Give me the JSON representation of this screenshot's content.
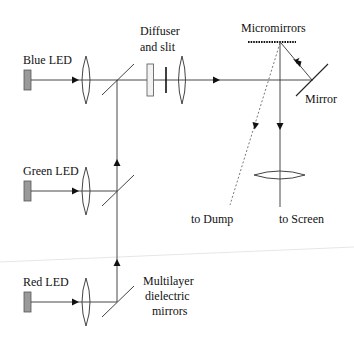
{
  "diagram": {
    "title": "",
    "labels": {
      "blue_led": "Blue LED",
      "green_led": "Green LED",
      "red_led": "Red LED",
      "diffuser_line1": "Diffuser",
      "diffuser_line2": "and slit",
      "micromirrors": "Micromirrors",
      "mirror": "Mirror",
      "to_dump": "to Dump",
      "to_screen": "to Screen",
      "dichroic_line1": "Multilayer",
      "dichroic_line2": "dielectric",
      "dichroic_line3": "mirrors"
    },
    "components": [
      {
        "id": "blue-led",
        "type": "light-source",
        "label": "Blue LED"
      },
      {
        "id": "green-led",
        "type": "light-source",
        "label": "Green LED"
      },
      {
        "id": "red-led",
        "type": "light-source",
        "label": "Red LED"
      },
      {
        "id": "condenser-lenses",
        "type": "lens",
        "count": 3
      },
      {
        "id": "dichroic-mirrors",
        "type": "beam-combiner",
        "label": "Multilayer dielectric mirrors",
        "count": 3
      },
      {
        "id": "diffuser",
        "type": "diffuser",
        "label": "Diffuser and slit"
      },
      {
        "id": "slit",
        "type": "slit"
      },
      {
        "id": "collimating-lens",
        "type": "lens"
      },
      {
        "id": "fold-mirror",
        "type": "mirror",
        "label": "Mirror"
      },
      {
        "id": "micromirror-array",
        "type": "dmd",
        "label": "Micromirrors"
      },
      {
        "id": "projection-lens",
        "type": "lens"
      }
    ],
    "paths": [
      {
        "from": "Red LED",
        "to": "Multilayer dielectric mirrors",
        "style": "solid"
      },
      {
        "from": "Green LED",
        "to": "Multilayer dielectric mirrors",
        "style": "solid"
      },
      {
        "from": "Blue LED",
        "to": "Multilayer dielectric mirrors",
        "style": "solid"
      },
      {
        "from": "Multilayer dielectric mirrors",
        "to": "Diffuser and slit",
        "style": "solid"
      },
      {
        "from": "Diffuser and slit",
        "to": "Mirror",
        "style": "solid"
      },
      {
        "from": "Mirror",
        "to": "Micromirrors",
        "style": "solid"
      },
      {
        "from": "Micromirrors",
        "to": "to Screen",
        "style": "solid"
      },
      {
        "from": "Micromirrors",
        "to": "to Dump",
        "style": "dashed"
      }
    ]
  }
}
